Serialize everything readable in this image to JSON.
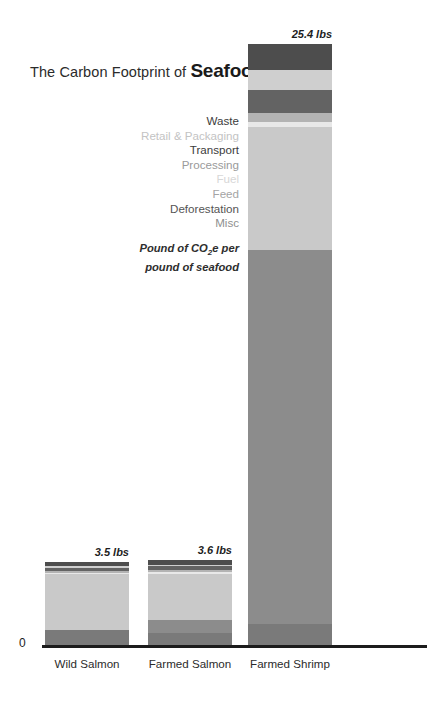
{
  "title": {
    "prefix": "The Carbon Footprint of ",
    "emphasis": "Seafood"
  },
  "caption": {
    "line1_a": "Pound of CO",
    "line1_sub": "2",
    "line1_b": "e per",
    "line2": "pound of seafood"
  },
  "axis": {
    "zero_label": "0"
  },
  "chart_data": {
    "type": "bar",
    "subtype": "stacked-bar",
    "title": "The Carbon Footprint of Seafood",
    "subtitle": "Pound of CO2e per pound of seafood",
    "xlabel": "",
    "ylabel": "",
    "ylim": [
      0,
      26.6
    ],
    "grid": false,
    "legend_position": "left-of-plot",
    "categories": [
      "Wild Salmon",
      "Farmed Salmon",
      "Farmed Shrimp"
    ],
    "value_labels": [
      "3.5 lbs",
      "3.6 lbs",
      "25.4 lbs"
    ],
    "totals": [
      3.5,
      3.6,
      25.4
    ],
    "series": [
      {
        "name": "Waste",
        "color": "#4d4d4d",
        "label_color": "#3c3c3c",
        "values": [
          0.18,
          0.21,
          1.1
        ]
      },
      {
        "name": "Retail & Packaging",
        "color": "#cfcfcf",
        "label_color": "#c3c3c3",
        "values": [
          0.06,
          0.07,
          0.85
        ]
      },
      {
        "name": "Transport",
        "color": "#636363",
        "label_color": "#3c3c3c",
        "values": [
          0.14,
          0.16,
          0.95
        ]
      },
      {
        "name": "Processing",
        "color": "#b3b3b3",
        "label_color": "#9a9a9a",
        "values": [
          0.08,
          0.09,
          0.4
        ]
      },
      {
        "name": "Fuel",
        "color": "#e8e8e8",
        "label_color": "#d7d7d7",
        "values": [
          0.04,
          0.07,
          0.2
        ]
      },
      {
        "name": "Feed",
        "color": "#c9c9c9",
        "label_color": "#a4a4a4",
        "values": [
          2.38,
          1.95,
          5.2
        ]
      },
      {
        "name": "Deforestation",
        "color": "#8c8c8c",
        "label_color": "#545454",
        "values": [
          0.0,
          0.55,
          15.8
        ]
      },
      {
        "name": "Misc",
        "color": "#7a7a7a",
        "label_color": "#8f8f8f",
        "values": [
          0.62,
          0.5,
          0.9
        ]
      }
    ]
  },
  "legend": {
    "items": [
      {
        "label": "Waste"
      },
      {
        "label": "Retail & Packaging"
      },
      {
        "label": "Transport"
      },
      {
        "label": "Processing"
      },
      {
        "label": "Fuel"
      },
      {
        "label": "Feed"
      },
      {
        "label": "Deforestation"
      },
      {
        "label": "Misc"
      }
    ]
  }
}
